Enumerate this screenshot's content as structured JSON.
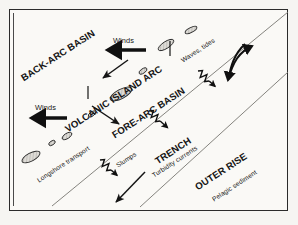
{
  "figure": {
    "type": "schematic-block-diagram",
    "background_color": "#f6f5f2",
    "ink_color": "#151515",
    "line_color": "#6d6d6d"
  },
  "zones": [
    {
      "id": "back-arc-basin",
      "label": "BACK-ARC BASIN",
      "style": "major",
      "x": 22,
      "y": 74,
      "rotate": -33,
      "size": 9.6
    },
    {
      "id": "volcanic-island-arc",
      "label": "VOLCANIC ISLAND ARC",
      "style": "major",
      "x": 66,
      "y": 125,
      "rotate": -33,
      "size": 9.6
    },
    {
      "id": "fore-arc-basin",
      "label": "FORE-ARC BASIN",
      "style": "major",
      "x": 113,
      "y": 131,
      "rotate": -33,
      "size": 9.6
    },
    {
      "id": "trench",
      "label": "TRENCH",
      "style": "major",
      "x": 156,
      "y": 157,
      "rotate": -33,
      "size": 9.6
    },
    {
      "id": "outer-rise",
      "label": "OUTER RISE",
      "style": "major",
      "x": 196,
      "y": 183,
      "rotate": -33,
      "size": 9.6
    }
  ],
  "process_labels": [
    {
      "id": "winds-upper",
      "label": "Winds",
      "x": 113,
      "y": 37,
      "rotate": 0,
      "size": 7.4
    },
    {
      "id": "winds-lower",
      "label": "Winds",
      "x": 35,
      "y": 104,
      "rotate": 0,
      "size": 7.4
    },
    {
      "id": "waves-tides",
      "label": "Waves, tides",
      "x": 182,
      "y": 58,
      "rotate": -33,
      "size": 6.6
    },
    {
      "id": "longshore-transport",
      "label": "Longshore transport",
      "x": 38,
      "y": 178,
      "rotate": -33,
      "size": 6.6
    },
    {
      "id": "slumps",
      "label": "Slumps",
      "x": 117,
      "y": 163,
      "rotate": -33,
      "size": 6.6
    },
    {
      "id": "turbidity-currents",
      "label": "Turbidity currents",
      "x": 153,
      "y": 173,
      "rotate": -33,
      "size": 6.6
    },
    {
      "id": "pelagic-sediment",
      "label": "Pelagic sediment",
      "x": 213,
      "y": 197,
      "rotate": -33,
      "size": 6.6
    }
  ],
  "geometry": {
    "boundary_lines": [
      {
        "id": "fore-arc-trench-boundary",
        "x1": 288,
        "y1": 12,
        "x2": 52,
        "y2": 206
      },
      {
        "id": "trench-outer-rise-boundary",
        "x1": 288,
        "y1": 72,
        "x2": 140,
        "y2": 207
      }
    ],
    "islands": [
      {
        "id": "island-1",
        "cx": 166,
        "cy": 45,
        "rx": 9,
        "ry": 3.4,
        "rotate": -33
      },
      {
        "id": "island-2",
        "cx": 143,
        "cy": 71,
        "rx": 4.5,
        "ry": 2.2,
        "rotate": -33
      },
      {
        "id": "island-3",
        "cx": 121,
        "cy": 94,
        "rx": 12,
        "ry": 4.6,
        "rotate": -28
      },
      {
        "id": "island-4",
        "cx": 92,
        "cy": 114,
        "rx": 4.2,
        "ry": 2.1,
        "rotate": -33
      },
      {
        "id": "island-5",
        "cx": 67,
        "cy": 136,
        "rx": 5.5,
        "ry": 2.6,
        "rotate": -33
      },
      {
        "id": "island-6",
        "cx": 52,
        "cy": 143,
        "rx": 3.6,
        "ry": 2.0,
        "rotate": -33
      },
      {
        "id": "island-7",
        "cx": 31,
        "cy": 157,
        "rx": 10,
        "ry": 4.0,
        "rotate": -28
      },
      {
        "id": "island-8",
        "cx": 191,
        "cy": 30,
        "rx": 6.5,
        "ry": 2.4,
        "rotate": -28
      }
    ],
    "wind_arrows": [
      {
        "id": "wind-arrow-upper",
        "x1": 146,
        "y1": 50,
        "x2": 105,
        "y2": 50,
        "weight": 3.4
      },
      {
        "id": "wind-arrow-lower",
        "x1": 67,
        "y1": 118,
        "x2": 29,
        "y2": 118,
        "weight": 3.4
      }
    ],
    "transport_arrows": [
      {
        "id": "arc-to-backarc-arrow",
        "x1": 128,
        "y1": 60,
        "x2": 100,
        "y2": 80,
        "weight": 1.5
      },
      {
        "id": "arc-to-forearc-arrow",
        "x1": 92,
        "y1": 106,
        "x2": 122,
        "y2": 126,
        "weight": 1.5
      },
      {
        "id": "deep-basin-arrow",
        "x1": 145,
        "y1": 172,
        "x2": 113,
        "y2": 205,
        "weight": 1.5
      }
    ],
    "volcano_ticks": [
      {
        "id": "volcano-tick-1",
        "x1": 170,
        "y1": 40,
        "x2": 170,
        "y2": 57
      },
      {
        "id": "volcano-tick-2",
        "x1": 88,
        "y1": 86,
        "x2": 88,
        "y2": 100
      }
    ],
    "turbidity_arrows": [
      {
        "id": "turbidity-arrow-trench",
        "x": 149,
        "y": 111,
        "angle": 42,
        "length": 26
      },
      {
        "id": "turbidity-arrow-east",
        "x": 198,
        "y": 71,
        "angle": 42,
        "length": 24
      },
      {
        "id": "turbidity-arrow-slump",
        "x": 100,
        "y": 160,
        "angle": 42,
        "length": 24
      }
    ],
    "subduction_curve": {
      "id": "subduction-flow-curve",
      "path": "M 246 44 C 238 57, 232 66, 226 82 L 226 82",
      "description": "double-headed curved arrow"
    }
  }
}
